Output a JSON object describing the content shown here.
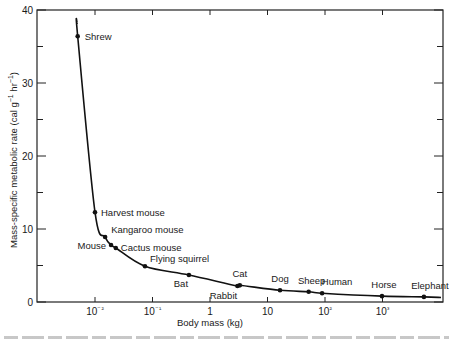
{
  "chart_data": {
    "type": "scatter",
    "title": "",
    "xlabel": "Body mass (kg)",
    "ylabel": "Mass-specific metabolic rate (cal g⁻¹ hr⁻¹)",
    "xscale": "log",
    "xlim": [
      0.0015,
      8000
    ],
    "ylim": [
      0,
      40
    ],
    "x_ticks": [
      0.01,
      0.1,
      1,
      10,
      100,
      1000
    ],
    "x_tick_labels": [
      "10⁻²",
      "10⁻¹",
      "1",
      "10",
      "10²",
      "10³"
    ],
    "y_ticks": [
      0,
      10,
      20,
      30,
      40
    ],
    "y_tick_labels": [
      "0",
      "10",
      "20",
      "30",
      "40"
    ],
    "y_minor_ticks": [
      5,
      15,
      25,
      35
    ],
    "grid": false,
    "legend": null,
    "fitted_curve": true,
    "series": [
      {
        "name": "Mammals",
        "points": [
          {
            "label": "Shrew",
            "mass_kg": 0.005,
            "rate": 36.4
          },
          {
            "label": "Harvest mouse",
            "mass_kg": 0.01,
            "rate": 12.3
          },
          {
            "label": "Kangaroo mouse",
            "mass_kg": 0.015,
            "rate": 8.9
          },
          {
            "label": "Mouse",
            "mass_kg": 0.019,
            "rate": 7.8
          },
          {
            "label": "Cactus mouse",
            "mass_kg": 0.023,
            "rate": 7.4
          },
          {
            "label": "Flying squirrel",
            "mass_kg": 0.074,
            "rate": 4.9
          },
          {
            "label": "Bat",
            "mass_kg": 0.43,
            "rate": 3.7
          },
          {
            "label": "Rabbit",
            "mass_kg": 3.0,
            "rate": 2.2
          },
          {
            "label": "Cat",
            "mass_kg": 3.3,
            "rate": 2.3
          },
          {
            "label": "Dog",
            "mass_kg": 16.5,
            "rate": 1.6
          },
          {
            "label": "Sheep",
            "mass_kg": 52,
            "rate": 1.4
          },
          {
            "label": "Human",
            "mass_kg": 89,
            "rate": 1.2
          },
          {
            "label": "Horse",
            "mass_kg": 980,
            "rate": 0.8
          },
          {
            "label": "Elephant",
            "mass_kg": 5250,
            "rate": 0.7
          }
        ]
      }
    ]
  },
  "labels": {
    "xlabel": "Body mass (kg)",
    "ylabel_main": "Mass-specific metabolic rate (cal g",
    "ylabel_sup1": "−1",
    "ylabel_mid": " hr",
    "ylabel_sup2": "−1",
    "ylabel_end": ")"
  }
}
